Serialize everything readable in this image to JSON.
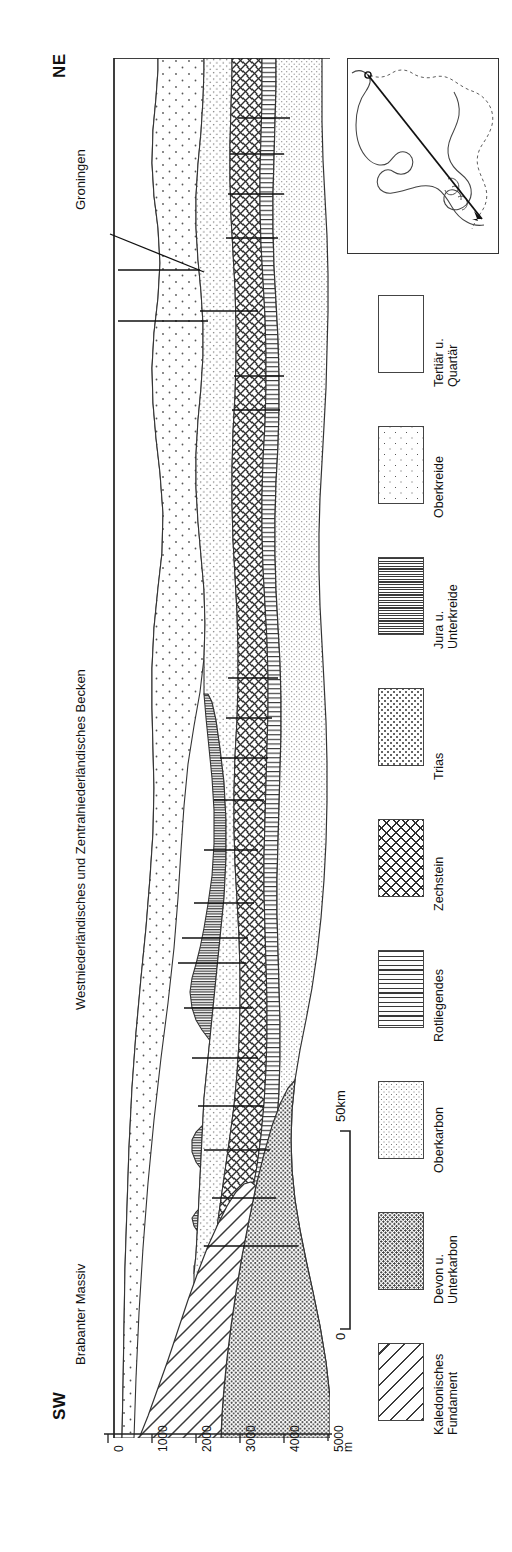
{
  "figure": {
    "type": "geological-cross-section",
    "orientation_left": "SW",
    "orientation_right": "NE",
    "place_labels": [
      "Brabanter Massiv",
      "Westniederländisches und Zentralniederländisches Becken",
      "Groningen"
    ]
  },
  "orientation": {
    "sw": "SW",
    "ne": "NE"
  },
  "places": {
    "brabant": "Brabanter Massiv",
    "basin": "Westniederländisches und Zentralniederländisches Becken",
    "groningen": "Groningen"
  },
  "depth_axis": {
    "unit": "m",
    "ticks": [
      "0",
      "1000",
      "2000",
      "3000",
      "4000",
      "5000"
    ],
    "values": [
      0,
      1000,
      2000,
      3000,
      4000,
      5000
    ],
    "min": 0,
    "max": 5000
  },
  "scale_bar": {
    "start_label": "0",
    "end_label": "50km",
    "length_km": 50
  },
  "inset": {
    "name": "locality-map-netherlands",
    "section_line": "SW-NE transect"
  },
  "legend": {
    "title": "",
    "items": [
      {
        "label": "Tertiär u.\nQuartär",
        "pattern": "blank",
        "key": "tertiary-quaternary"
      },
      {
        "label": "Oberkreide",
        "pattern": "oberkreide",
        "key": "upper-cretaceous"
      },
      {
        "label": "Jura u.\nUnterkreide",
        "pattern": "jura",
        "key": "jurassic-lower-cretaceous"
      },
      {
        "label": "Trias",
        "pattern": "trias",
        "key": "triassic"
      },
      {
        "label": "Zechstein",
        "pattern": "zechstein",
        "key": "zechstein"
      },
      {
        "label": "Rotliegendes",
        "pattern": "rotliegendes",
        "key": "rotliegend"
      },
      {
        "label": "Oberkarbon",
        "pattern": "oberkarbon",
        "key": "upper-carboniferous"
      },
      {
        "label": "Devon u.\nUnterkarbon",
        "pattern": "devon",
        "key": "devonian-lower-carboniferous"
      },
      {
        "label": "Kaledonisches\nFundament",
        "pattern": "kaledon",
        "key": "caledonian-basement"
      }
    ]
  },
  "chart_data": {
    "type": "area",
    "xlabel": "",
    "ylabel": "m",
    "ylim": [
      0,
      5000
    ],
    "xlim_km": [
      0,
      260
    ],
    "grid": false,
    "legend_position": "right",
    "units": [
      "Tertiär u. Quartär",
      "Oberkreide",
      "Jura u. Unterkreide",
      "Trias",
      "Zechstein",
      "Rotliegendes",
      "Oberkarbon",
      "Devon u. Unterkarbon",
      "Kaledonisches Fundament"
    ]
  }
}
